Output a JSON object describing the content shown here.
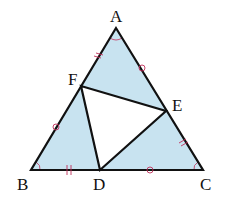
{
  "diagram": {
    "type": "geometry-triangle",
    "colors": {
      "fill": "#c8e3f0",
      "stroke": "#111111",
      "marks": "#c0305a",
      "background": "#ffffff"
    },
    "points": {
      "A": {
        "label": "A",
        "x": 116,
        "y": 28
      },
      "B": {
        "label": "B",
        "x": 31,
        "y": 170
      },
      "C": {
        "label": "C",
        "x": 203,
        "y": 170
      },
      "D": {
        "label": "D",
        "x": 100,
        "y": 170
      },
      "E": {
        "label": "E",
        "x": 166,
        "y": 111
      },
      "F": {
        "label": "F",
        "x": 81,
        "y": 86
      }
    },
    "labels": {
      "A": "A",
      "B": "B",
      "C": "C",
      "D": "D",
      "E": "E",
      "F": "F"
    },
    "equal_segments": [
      {
        "mark": "double-tick",
        "segments": [
          "AF",
          "BD",
          "CE"
        ]
      },
      {
        "mark": "circle",
        "segments": [
          "AE",
          "BF",
          "CD"
        ]
      }
    ],
    "equal_angles": [
      "A",
      "B",
      "C"
    ],
    "inner_triangle": "DEF"
  }
}
